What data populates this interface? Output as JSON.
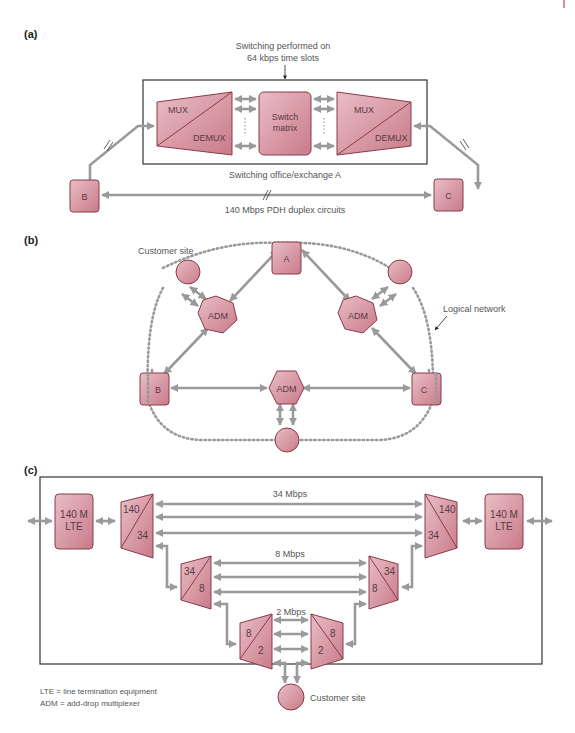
{
  "colors": {
    "node_fill_light": "#e7b9c1",
    "node_fill_dark": "#c97a89",
    "node_stroke": "#8a3a4a",
    "connector": "#9a9a9a",
    "frame": "#333333"
  },
  "panels": {
    "a": {
      "label": "(a)",
      "annotation_line1": "Switching performed on",
      "annotation_line2": "64 kbps time slots",
      "left_mux": {
        "top": "MUX",
        "bottom": "DEMUX"
      },
      "switch_matrix": {
        "line1": "Switch",
        "line2": "matrix"
      },
      "right_mux": {
        "top": "MUX",
        "bottom": "DEMUX"
      },
      "office_caption": "Switching office/exchange A",
      "node_b": "B",
      "node_c": "C",
      "link_caption": "140 Mbps PDH duplex circuits"
    },
    "b": {
      "label": "(b)",
      "customer_site_label": "Customer site",
      "node_a": "A",
      "node_b": "B",
      "node_c": "C",
      "adm_left": "ADM",
      "adm_right": "ADM",
      "adm_bottom": "ADM",
      "logical_network_label": "Logical network"
    },
    "c": {
      "label": "(c)",
      "lte_left": {
        "line1": "140 M",
        "line2": "LTE"
      },
      "lte_right": {
        "line1": "140 M",
        "line2": "LTE"
      },
      "mux_140_left": {
        "top": "140",
        "bottom": "34"
      },
      "mux_140_right": {
        "top": "140",
        "bottom": "34"
      },
      "rate_34": "34 Mbps",
      "mux_34_left": {
        "top": "34",
        "bottom": "8"
      },
      "mux_34_right": {
        "top": "34",
        "bottom": "8"
      },
      "rate_8": "8 Mbps",
      "mux_8_left": {
        "top": "8",
        "bottom": "2"
      },
      "mux_8_right": {
        "top": "8",
        "bottom": "2"
      },
      "rate_2": "2 Mbps",
      "customer_site_label": "Customer site",
      "legend": [
        "LTE = line termination equipment",
        "ADM = add-drop multiplexer"
      ]
    }
  }
}
